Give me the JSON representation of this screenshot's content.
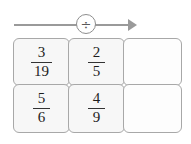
{
  "widget": {
    "type": "fraction-division-grid",
    "operator": {
      "symbol": "÷",
      "name": "division-operator",
      "arrow_direction": "right"
    },
    "colors": {
      "arrow": "#9a9a9a",
      "cell_border": "#a8a8a8",
      "cell_fill": "#f7f7f7",
      "empty_cell_fill": "#fdfdfd",
      "text": "#1d1d1d"
    },
    "grid": {
      "columns": 3,
      "rows": 2,
      "cells": [
        {
          "row": 0,
          "col": 0,
          "empty": false,
          "numerator": "3",
          "denominator": "19"
        },
        {
          "row": 0,
          "col": 1,
          "empty": false,
          "numerator": "2",
          "denominator": "5"
        },
        {
          "row": 0,
          "col": 2,
          "empty": true,
          "numerator": "",
          "denominator": ""
        },
        {
          "row": 1,
          "col": 0,
          "empty": false,
          "numerator": "5",
          "denominator": "6"
        },
        {
          "row": 1,
          "col": 1,
          "empty": false,
          "numerator": "4",
          "denominator": "9"
        },
        {
          "row": 1,
          "col": 2,
          "empty": true,
          "numerator": "",
          "denominator": ""
        }
      ]
    }
  }
}
